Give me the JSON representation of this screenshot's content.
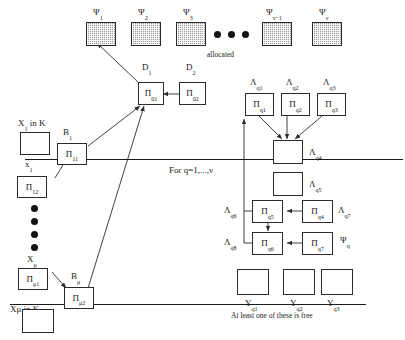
{
  "diagram": {
    "title_caption": "allocated",
    "loop_note": "For q=1,...,ν",
    "footer_note": "At least one of these is free",
    "colors": {
      "stroke": "#2b2b2b",
      "text": "#1a1a1a",
      "hatch_fill": "#9a9a9a",
      "background": "#ffffff"
    }
  },
  "psi_row": {
    "items": [
      {
        "label": "Ψ",
        "sub": "1"
      },
      {
        "label": "Ψ",
        "sub": "2"
      },
      {
        "label": "Ψ",
        "sub": "3"
      },
      {
        "label": "Ψ",
        "sub": "ν−1"
      },
      {
        "label": "Ψ",
        "sub": "ν"
      }
    ],
    "ellipsis_count": 3
  },
  "center": {
    "d1_label": "D",
    "d1_sub": "1",
    "d2_label": "D",
    "d2_sub": "2",
    "pi01": "Π",
    "pi01_sub": "01",
    "pi02": "Π",
    "pi02_sub": "02"
  },
  "left_group_top": {
    "x_label": "X",
    "x_sub": "1",
    "x_in_k": "X₁ in K",
    "xbar_label": "x",
    "xbar_sub": "1",
    "b_label": "B",
    "b_sub": "1",
    "pi11": "Π",
    "pi11_sub": "11",
    "pi12": "Π",
    "pi12_sub": "12"
  },
  "left_group_bottom": {
    "x_label": "X",
    "x_sub": "μ",
    "xbar_in_k": "Xμ in K",
    "b_label": "B",
    "b_sub": "μ",
    "pim1": "Π",
    "pim1_sub": "μ1",
    "pim2": "Π",
    "pim2_sub": "μ2"
  },
  "right_group": {
    "lambda_labels": [
      {
        "label": "Λ",
        "sub": "q1"
      },
      {
        "label": "Λ",
        "sub": "q2"
      },
      {
        "label": "Λ",
        "sub": "q3"
      },
      {
        "label": "Λ",
        "sub": "q4"
      },
      {
        "label": "Λ",
        "sub": "q5"
      },
      {
        "label": "Λ",
        "sub": "q6"
      },
      {
        "label": "Λ",
        "sub": "q7"
      },
      {
        "label": "Λ",
        "sub": "q8"
      }
    ],
    "psi_q": {
      "label": "Ψ",
      "sub": "q"
    },
    "pi_nodes": [
      {
        "label": "Π",
        "sub": "q1"
      },
      {
        "label": "Π",
        "sub": "q2"
      },
      {
        "label": "Π",
        "sub": "q3"
      },
      {
        "label": "Π",
        "sub": "q4"
      },
      {
        "label": "Π",
        "sub": "q5"
      },
      {
        "label": "Π",
        "sub": "q6"
      },
      {
        "label": "Π",
        "sub": "q7"
      }
    ],
    "y_labels": [
      {
        "label": "Y",
        "sub": "q1"
      },
      {
        "label": "Y",
        "sub": "q2"
      },
      {
        "label": "Y",
        "sub": "q3"
      }
    ]
  }
}
